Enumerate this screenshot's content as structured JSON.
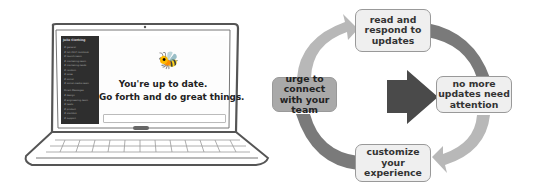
{
  "laptop": {
    "sidebar": {
      "title": "Jolie Clothing",
      "items": [
        "# general",
        "# fall-2017-lookbook",
        "# launch-team",
        "# marketing-team",
        "# marketing-leads",
        "# random",
        "# sales",
        "# social",
        "# social-media-team",
        "Direct Messages",
        "# design",
        "# engineering-team",
        "# leads",
        "# product",
        "# slackbot",
        "# support",
        "# team"
      ]
    },
    "main": {
      "empty_state_icon": "bee-icon",
      "line1": "You're up to date.",
      "line2": "Go forth and do great things."
    }
  },
  "diagram": {
    "nodes": {
      "top": "read and respond to updates",
      "right": "no more updates need attention",
      "bottom": "customize your experience",
      "left": "urge to connect with your team"
    },
    "colors": {
      "arrow_dark": "#7a7a7a",
      "arrow_light": "#b8b8b8",
      "center_arrow": "#4a4a4a",
      "box_light": "#efefef",
      "box_dark": "#a9a9a9"
    }
  }
}
